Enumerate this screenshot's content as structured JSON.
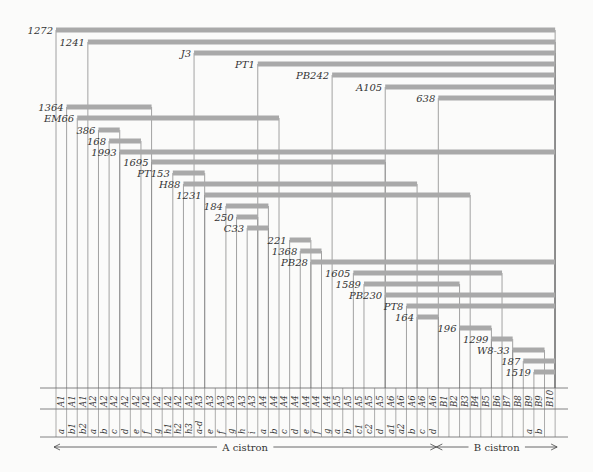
{
  "diagram": {
    "bar_color": "#a9a9a9",
    "line_color": "#8c8c8c",
    "grid_left": 56,
    "col_width": 10.62,
    "columns": [
      {
        "region": "A1",
        "sub": "a"
      },
      {
        "region": "A1",
        "sub": "b1"
      },
      {
        "region": "A1",
        "sub": "b2"
      },
      {
        "region": "A2",
        "sub": "a"
      },
      {
        "region": "A2",
        "sub": "b"
      },
      {
        "region": "A2",
        "sub": "c"
      },
      {
        "region": "A2",
        "sub": "d"
      },
      {
        "region": "A2",
        "sub": "e"
      },
      {
        "region": "A2",
        "sub": "f"
      },
      {
        "region": "A2",
        "sub": "g"
      },
      {
        "region": "A2",
        "sub": "h1"
      },
      {
        "region": "A2",
        "sub": "h2"
      },
      {
        "region": "A2",
        "sub": "h3"
      },
      {
        "region": "A3",
        "sub": "a-d"
      },
      {
        "region": "A3",
        "sub": "e"
      },
      {
        "region": "A3",
        "sub": "f"
      },
      {
        "region": "A3",
        "sub": "g"
      },
      {
        "region": "A3",
        "sub": "h"
      },
      {
        "region": "A3",
        "sub": "i"
      },
      {
        "region": "A4",
        "sub": "a"
      },
      {
        "region": "A4",
        "sub": "b"
      },
      {
        "region": "A4",
        "sub": "c"
      },
      {
        "region": "A4",
        "sub": "d"
      },
      {
        "region": "A4",
        "sub": "e"
      },
      {
        "region": "A4",
        "sub": "f"
      },
      {
        "region": "A4",
        "sub": "g"
      },
      {
        "region": "A5",
        "sub": "a"
      },
      {
        "region": "A5",
        "sub": "b"
      },
      {
        "region": "A5",
        "sub": "c1"
      },
      {
        "region": "A5",
        "sub": "c2"
      },
      {
        "region": "A5",
        "sub": "d"
      },
      {
        "region": "A6",
        "sub": "a1"
      },
      {
        "region": "A6",
        "sub": "a2"
      },
      {
        "region": "A6",
        "sub": "b"
      },
      {
        "region": "A6",
        "sub": "c"
      },
      {
        "region": "A6",
        "sub": "d"
      },
      {
        "region": "B1",
        "sub": ""
      },
      {
        "region": "B2",
        "sub": ""
      },
      {
        "region": "B3",
        "sub": ""
      },
      {
        "region": "B4",
        "sub": ""
      },
      {
        "region": "B5",
        "sub": ""
      },
      {
        "region": "B6",
        "sub": ""
      },
      {
        "region": "B7",
        "sub": ""
      },
      {
        "region": "B8",
        "sub": ""
      },
      {
        "region": "B9",
        "sub": "a"
      },
      {
        "region": "B9",
        "sub": "b"
      },
      {
        "region": "B10",
        "sub": ""
      }
    ],
    "deletions": [
      {
        "name": "1272",
        "start": 0,
        "end": 47,
        "y": 30
      },
      {
        "name": "1241",
        "start": 3,
        "end": 47,
        "y": 42
      },
      {
        "name": "J3",
        "start": 13,
        "end": 47,
        "y": 53
      },
      {
        "name": "PT1",
        "start": 19,
        "end": 47,
        "y": 64
      },
      {
        "name": "PB242",
        "start": 26,
        "end": 47,
        "y": 75
      },
      {
        "name": "A105",
        "start": 31,
        "end": 47,
        "y": 87
      },
      {
        "name": "638",
        "start": 36,
        "end": 47,
        "y": 98
      },
      {
        "name": "1364",
        "start": 1,
        "end": 9,
        "y": 107
      },
      {
        "name": "EM66",
        "start": 2,
        "end": 21,
        "y": 118
      },
      {
        "name": "386",
        "start": 4,
        "end": 6,
        "y": 130
      },
      {
        "name": "168",
        "start": 5,
        "end": 8,
        "y": 141
      },
      {
        "name": "1993",
        "start": 6,
        "end": 47,
        "y": 152
      },
      {
        "name": "1695",
        "start": 9,
        "end": 31,
        "y": 162
      },
      {
        "name": "PT153",
        "start": 11,
        "end": 14,
        "y": 173
      },
      {
        "name": "H88",
        "start": 12,
        "end": 34,
        "y": 184
      },
      {
        "name": "1231",
        "start": 14,
        "end": 39,
        "y": 195
      },
      {
        "name": "184",
        "start": 16,
        "end": 20,
        "y": 206
      },
      {
        "name": "250",
        "start": 17,
        "end": 19,
        "y": 217
      },
      {
        "name": "C33",
        "start": 18,
        "end": 20,
        "y": 228
      },
      {
        "name": "221",
        "start": 22,
        "end": 24,
        "y": 240
      },
      {
        "name": "1368",
        "start": 23,
        "end": 25,
        "y": 251
      },
      {
        "name": "PB28",
        "start": 24,
        "end": 47,
        "y": 262
      },
      {
        "name": "1605",
        "start": 28,
        "end": 42,
        "y": 273
      },
      {
        "name": "1589",
        "start": 29,
        "end": 38,
        "y": 284
      },
      {
        "name": "PB230",
        "start": 31,
        "end": 47,
        "y": 295
      },
      {
        "name": "PT8",
        "start": 33,
        "end": 47,
        "y": 306
      },
      {
        "name": "164",
        "start": 34,
        "end": 36,
        "y": 317
      },
      {
        "name": "196",
        "start": 38,
        "end": 41,
        "y": 328
      },
      {
        "name": "1299",
        "start": 41,
        "end": 43,
        "y": 339
      },
      {
        "name": "W8-33",
        "start": 43,
        "end": 46,
        "y": 350
      },
      {
        "name": "187",
        "start": 44,
        "end": 47,
        "y": 361
      },
      {
        "name": "1519",
        "start": 45,
        "end": 47,
        "y": 372
      }
    ],
    "cistrons": [
      {
        "label": "A cistron",
        "start": 0,
        "end": 36
      },
      {
        "label": "B cistron",
        "start": 36,
        "end": 47
      }
    ]
  }
}
